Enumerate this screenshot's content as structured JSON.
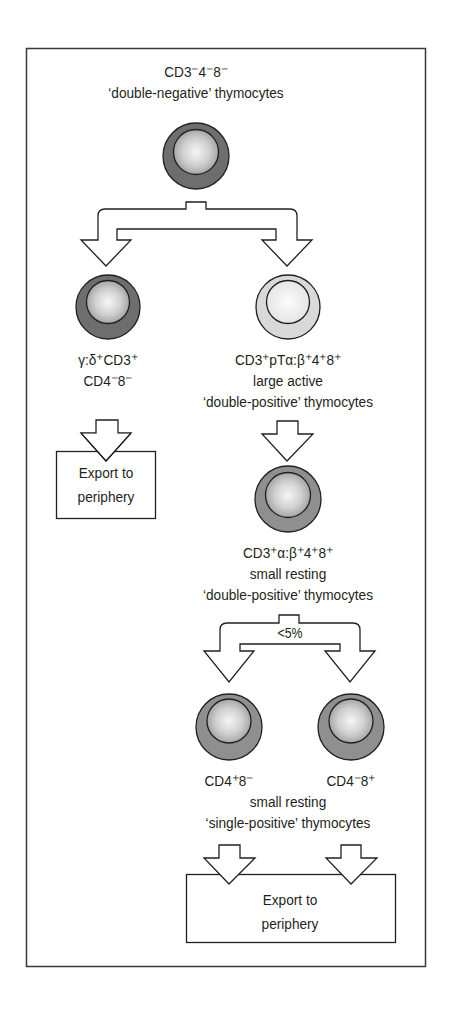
{
  "diagram": {
    "type": "flowchart",
    "colors": {
      "frame": "#3a3a3a",
      "line": "#231f20",
      "cell_dark_ring": "#6e6e6e",
      "cell_medium_ring": "#8f8f8f",
      "cell_light_ring": "#d9d9d9",
      "nucleus_highlight": "#f4f4f4",
      "nucleus_shadow": "#9a9a9a"
    },
    "nodes": {
      "double_negative": {
        "line1": "CD3⁻4⁻8⁻",
        "line2": "‘double-negative’ thymocytes"
      },
      "gamma_delta": {
        "line1": "γ:δ⁺CD3⁺",
        "line2": "CD4⁻8⁻"
      },
      "large_double_positive": {
        "line1": "CD3⁺pTα:β⁺4⁺8⁺",
        "line2": "large active",
        "line3": "‘double-positive’ thymocytes"
      },
      "small_double_positive": {
        "line1": "CD3⁺α:β⁺4⁺8⁺",
        "line2": "small resting",
        "line3": "‘double-positive’ thymocytes"
      },
      "single_positive_cd4": {
        "line1": "CD4⁺8⁻"
      },
      "single_positive_cd8": {
        "line1": "CD4⁻8⁺"
      },
      "single_positive_shared": {
        "line2": "small resting",
        "line3": "‘single-positive’ thymocytes"
      },
      "export_left": {
        "line1": "Export to",
        "line2": "periphery"
      },
      "export_bottom": {
        "line1": "Export to",
        "line2": "periphery"
      }
    },
    "annotations": {
      "branch_fraction": "<5%"
    },
    "edges": [
      {
        "from": "double_negative",
        "to": "gamma_delta"
      },
      {
        "from": "double_negative",
        "to": "large_double_positive"
      },
      {
        "from": "gamma_delta",
        "to": "export_left"
      },
      {
        "from": "large_double_positive",
        "to": "small_double_positive"
      },
      {
        "from": "small_double_positive",
        "to": "single_positive_cd4",
        "label": "<5%"
      },
      {
        "from": "small_double_positive",
        "to": "single_positive_cd8",
        "label": "<5%"
      },
      {
        "from": "single_positive_cd4",
        "to": "export_bottom"
      },
      {
        "from": "single_positive_cd8",
        "to": "export_bottom"
      }
    ]
  }
}
